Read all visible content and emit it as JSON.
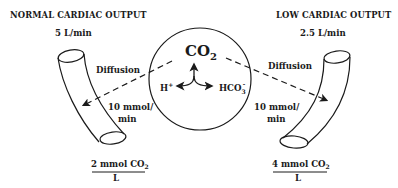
{
  "left_panel": {
    "title": "NORMAL CARDIAC OUTPUT",
    "flow": "5 L/min",
    "diffusion_label": "Diffusion",
    "rate_line1": "10 mmol/",
    "rate_line2": "min",
    "concentration_numerator": "2 mmol CO",
    "concentration_subscript": "2",
    "concentration_denominator": "L"
  },
  "center": {
    "molecule": "CO",
    "molecule_subscript": "2",
    "left_product": "H",
    "left_product_superscript": "+",
    "right_product": "HCO",
    "right_product_subscript": "3",
    "right_product_superscript": "-"
  },
  "right_panel": {
    "title": "LOW CARDIAC OUTPUT",
    "flow": "2.5 L/min",
    "diffusion_label": "Diffusion",
    "rate_line1": "10 mmol/",
    "rate_line2": "min",
    "concentration_numerator": "4 mmol CO",
    "concentration_subscript": "2",
    "concentration_denominator": "L"
  },
  "colors": {
    "ink": "#1a1a1a",
    "background": "#ffffff"
  }
}
